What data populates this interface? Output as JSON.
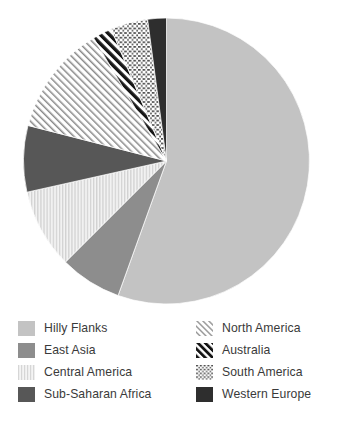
{
  "chart_data": {
    "type": "pie",
    "title": "",
    "subtitle": "",
    "xlabel": "",
    "ylabel": "",
    "grid": false,
    "legend_position": "bottom",
    "start_angle_deg": 0,
    "direction": "clockwise",
    "categories": [
      "Hilly Flanks",
      "East Asia",
      "Central America",
      "Sub-Saharan Africa",
      "North America",
      "Australia",
      "South America",
      "Western Europe"
    ],
    "values": [
      55.5,
      7.0,
      9.0,
      7.5,
      12.5,
      2.2,
      4.2,
      2.1
    ],
    "units": "percent",
    "slices": [
      {
        "label": "Hilly Flanks",
        "value": 55.5,
        "pattern": "solid",
        "color": "#c3c3c3",
        "start_angle_deg": 0,
        "end_angle_deg": 199.8
      },
      {
        "label": "East Asia",
        "value": 7.0,
        "pattern": "solid",
        "color": "#8d8d8d",
        "start_angle_deg": 199.8,
        "end_angle_deg": 225.0
      },
      {
        "label": "Central America",
        "value": 9.0,
        "pattern": "vertical-lines",
        "color": "#e2e2e2",
        "start_angle_deg": 225.0,
        "end_angle_deg": 257.4
      },
      {
        "label": "Sub-Saharan Africa",
        "value": 7.5,
        "pattern": "solid",
        "color": "#575757",
        "start_angle_deg": 257.4,
        "end_angle_deg": 284.4
      },
      {
        "label": "North America",
        "value": 12.5,
        "pattern": "diagonal-lines-light",
        "color": "#ffffff",
        "start_angle_deg": 284.4,
        "end_angle_deg": 329.4
      },
      {
        "label": "Australia",
        "value": 2.2,
        "pattern": "diagonal-lines-bold",
        "color": "#1d1d1d",
        "start_angle_deg": 329.4,
        "end_angle_deg": 337.3
      },
      {
        "label": "South America",
        "value": 4.2,
        "pattern": "crosshatch-dots",
        "color": "#585858",
        "start_angle_deg": 337.3,
        "end_angle_deg": 352.4
      },
      {
        "label": "Western Europe",
        "value": 2.1,
        "pattern": "solid",
        "color": "#2e2e2e",
        "start_angle_deg": 352.4,
        "end_angle_deg": 360.0
      }
    ]
  },
  "legend": {
    "columns": [
      {
        "items": [
          {
            "label": "Hilly Flanks",
            "pattern": "solid",
            "color": "#c3c3c3"
          },
          {
            "label": "East Asia",
            "pattern": "solid",
            "color": "#8d8d8d"
          },
          {
            "label": "Central America",
            "pattern": "vertical-lines",
            "color": "#e2e2e2"
          },
          {
            "label": "Sub-Saharan Africa",
            "pattern": "solid",
            "color": "#575757"
          }
        ]
      },
      {
        "items": [
          {
            "label": "North America",
            "pattern": "diagonal-lines-light",
            "color": "#ffffff"
          },
          {
            "label": "Australia",
            "pattern": "diagonal-lines-bold",
            "color": "#1d1d1d"
          },
          {
            "label": "South America",
            "pattern": "crosshatch-dots",
            "color": "#585858"
          },
          {
            "label": "Western Europe",
            "pattern": "solid",
            "color": "#2e2e2e"
          }
        ]
      }
    ]
  }
}
